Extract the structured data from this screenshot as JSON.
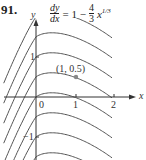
{
  "problem_number": "91.",
  "equation": {
    "lhs_num": "dy",
    "lhs_den": "dx",
    "equals": "= 1 −",
    "coef_num": "4",
    "coef_den": "3",
    "var": "x",
    "exponent": "1/3"
  },
  "chart_data": {
    "type": "line",
    "xlabel": "x",
    "ylabel": "y",
    "x_ticks": [
      0,
      1,
      2
    ],
    "y_ticks": [
      1,
      -1
    ],
    "xlim": [
      -0.9,
      2.5
    ],
    "ylim": [
      -1.6,
      2.4
    ],
    "grid": false,
    "family": "y = x - x^(4/3) + C",
    "series": [
      {
        "name": "C = 2",
        "C": 2
      },
      {
        "name": "C = 1.5",
        "C": 1.5
      },
      {
        "name": "C = 1",
        "C": 1
      },
      {
        "name": "C = 0.5",
        "C": 0.5
      },
      {
        "name": "C = 0",
        "C": 0
      },
      {
        "name": "C = -0.5",
        "C": -0.5
      },
      {
        "name": "C = -1",
        "C": -1
      },
      {
        "name": "C = -1.5",
        "C": -1.5
      }
    ],
    "highlighted_point": {
      "x": 1,
      "y": 0.5,
      "label": "(1, 0.5)"
    }
  },
  "labels": {
    "x_axis": "x",
    "y_axis": "y",
    "tick_0": "0",
    "tick_1": "1",
    "tick_2": "2",
    "ytick_1": "1",
    "ytick_m1": "−1",
    "point": "(1, 0.5)"
  }
}
